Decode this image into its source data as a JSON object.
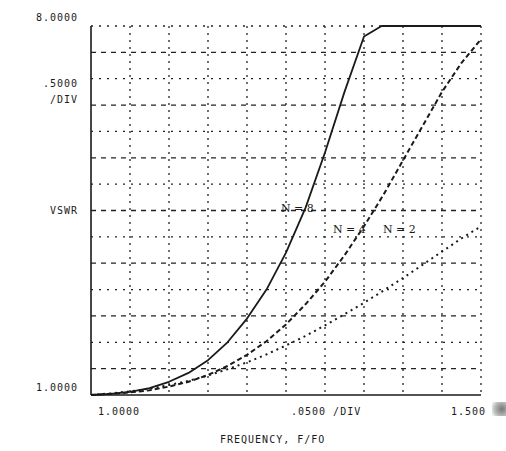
{
  "labels": {
    "y_top": "8.0000",
    "y_scale": ".5000",
    "y_scale_unit": "/DIV",
    "y_axis": "VSWR",
    "y_bottom": "1.0000",
    "x_left": "1.0000",
    "x_scale": ".0500 /DIV",
    "x_right": "1.500",
    "x_axis": "FREQUENCY, F/FO",
    "curve_n8": "N = 8",
    "curve_n4": "N = 4",
    "curve_n2": "N = 2"
  },
  "colors": {
    "ink": "#1a1a1a",
    "grid": "#222222",
    "background": "#ffffff"
  },
  "chart_data": {
    "type": "line",
    "title": "",
    "xlabel": "FREQUENCY, F/FO",
    "ylabel": "VSWR",
    "xlim": [
      1.0,
      1.5
    ],
    "ylim": [
      1.0,
      8.0
    ],
    "x_div": 0.05,
    "y_div": 0.5,
    "grid": true,
    "legend": "inline annotations",
    "tick_labels": {
      "x": [
        "1.0000",
        ".0500 /DIV",
        "1.500"
      ],
      "y": [
        "8.0000",
        ".5000 /DIV",
        "VSWR",
        "1.0000"
      ]
    },
    "series": [
      {
        "name": "N = 8",
        "style": "solid",
        "x": [
          1.0,
          1.025,
          1.05,
          1.075,
          1.1,
          1.125,
          1.15,
          1.175,
          1.2,
          1.225,
          1.25,
          1.275,
          1.3,
          1.325,
          1.35,
          1.3725,
          1.38,
          1.5
        ],
        "y": [
          1.0,
          1.02,
          1.06,
          1.13,
          1.25,
          1.42,
          1.66,
          2.0,
          2.45,
          3.0,
          3.7,
          4.55,
          5.6,
          6.75,
          7.8,
          8.0,
          8.0,
          8.0
        ]
      },
      {
        "name": "N = 4",
        "style": "dashed",
        "x": [
          1.0,
          1.025,
          1.05,
          1.075,
          1.1,
          1.125,
          1.15,
          1.175,
          1.2,
          1.225,
          1.25,
          1.275,
          1.3,
          1.325,
          1.35,
          1.375,
          1.4,
          1.425,
          1.45,
          1.475,
          1.5
        ],
        "y": [
          1.0,
          1.02,
          1.05,
          1.09,
          1.16,
          1.25,
          1.38,
          1.55,
          1.76,
          2.02,
          2.34,
          2.72,
          3.15,
          3.65,
          4.2,
          4.8,
          5.45,
          6.1,
          6.75,
          7.3,
          7.75
        ]
      },
      {
        "name": "N = 2",
        "style": "dotted",
        "x": [
          1.0,
          1.025,
          1.05,
          1.075,
          1.1,
          1.125,
          1.15,
          1.175,
          1.2,
          1.225,
          1.25,
          1.275,
          1.3,
          1.325,
          1.35,
          1.375,
          1.4,
          1.425,
          1.45,
          1.475,
          1.5
        ],
        "y": [
          1.0,
          1.03,
          1.07,
          1.12,
          1.19,
          1.27,
          1.37,
          1.49,
          1.62,
          1.77,
          1.94,
          2.12,
          2.32,
          2.53,
          2.75,
          2.98,
          3.22,
          3.47,
          3.72,
          3.97,
          4.2
        ]
      }
    ]
  }
}
